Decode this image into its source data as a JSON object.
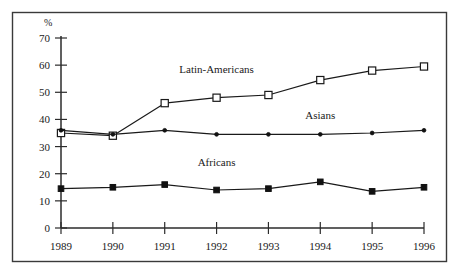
{
  "chart_data": {
    "type": "line",
    "title": "",
    "subtitle": "",
    "xlabel": "",
    "ylabel": "%",
    "y_unit_label": "%",
    "categories": [
      "1989",
      "1990",
      "1991",
      "1992",
      "1993",
      "1994",
      "1995",
      "1996"
    ],
    "x": [
      1989,
      1990,
      1991,
      1992,
      1993,
      1994,
      1995,
      1996
    ],
    "xlim": [
      1989,
      1996
    ],
    "ylim": [
      0,
      70
    ],
    "yticks": [
      0,
      10,
      20,
      30,
      40,
      50,
      60,
      70
    ],
    "ytick_labels": [
      "0",
      "10",
      "20",
      "30",
      "40",
      "50",
      "60",
      "70"
    ],
    "xtick_labels": [
      "1989",
      "1990",
      "1991",
      "1992",
      "1993",
      "1994",
      "1995",
      "1996"
    ],
    "grid": false,
    "legend_position": "inline-annotations",
    "series": [
      {
        "name": "Latin-Americans",
        "marker": "open-square",
        "values": [
          35,
          34,
          46,
          48,
          49,
          54.5,
          58,
          59.5
        ],
        "label_x": 1992,
        "label_y": 57
      },
      {
        "name": "Asians",
        "marker": "dot",
        "values": [
          36,
          34.5,
          36,
          34.5,
          34.5,
          34.5,
          35,
          36
        ],
        "label_x": 1994,
        "label_y": 40
      },
      {
        "name": "Africans",
        "marker": "filled-square",
        "values": [
          14.5,
          15,
          16,
          14,
          14.5,
          17,
          13.5,
          15
        ],
        "label_x": 1992,
        "label_y": 23
      }
    ],
    "annotations": [
      {
        "text": "Latin-Americans",
        "series": "Latin-Americans"
      },
      {
        "text": "Asians",
        "series": "Asians"
      },
      {
        "text": "Africans",
        "series": "Africans"
      }
    ]
  }
}
